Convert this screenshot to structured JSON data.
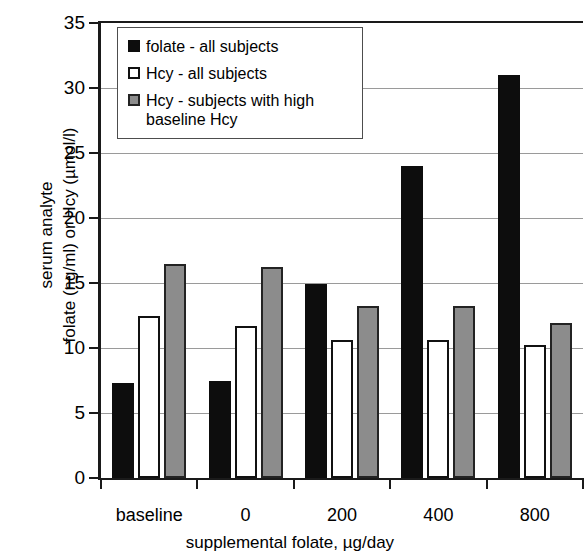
{
  "chart_data": {
    "type": "bar",
    "title": "",
    "xlabel": "supplemental folate, µg/day",
    "ylabel_line1": "serum analyte",
    "ylabel_line2": "folate (ng/ml) or Hcy (µmol/l)",
    "categories": [
      "baseline",
      "0",
      "200",
      "400",
      "800"
    ],
    "series": [
      {
        "name": "folate - all subjects",
        "key": "folate",
        "color": "#0d0d0d",
        "values": [
          7.3,
          7.5,
          14.9,
          24.0,
          31.0
        ]
      },
      {
        "name": "Hcy - all subjects",
        "key": "hcy",
        "color": "#ffffff",
        "values": [
          12.5,
          11.7,
          10.6,
          10.6,
          10.2
        ]
      },
      {
        "name": "Hcy - subjects with high\nbaseline Hcy",
        "key": "hcyhigh",
        "color": "#8c8c8c",
        "values": [
          16.5,
          16.2,
          13.2,
          13.2,
          11.9
        ]
      }
    ],
    "ylim": [
      0,
      35
    ],
    "ytick_values": [
      0,
      5,
      10,
      15,
      20,
      25,
      30,
      35
    ],
    "ytick_labels": [
      "0",
      "5",
      "10",
      "15",
      "20",
      "25",
      "30",
      "35"
    ],
    "grid": true,
    "grid_axis": "y",
    "legend_position": "top-left-inside",
    "axis_color": "#1a1a1a",
    "grid_color": "#9a9a9a"
  },
  "legend": {
    "items": [
      {
        "label": "folate - all subjects"
      },
      {
        "label": "Hcy - all subjects"
      },
      {
        "label": "Hcy - subjects with high\nbaseline Hcy"
      }
    ]
  }
}
